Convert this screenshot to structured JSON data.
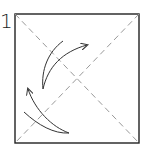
{
  "diagram": {
    "step_number": "1",
    "paper": {
      "stroke": "#222222",
      "fill": "#ffffff"
    },
    "creases": {
      "type": "dashed diagonal",
      "color": "#888888"
    },
    "arrows": [
      {
        "name": "fold-arrow-upper",
        "direction": "toward top-right"
      },
      {
        "name": "fold-arrow-lower",
        "direction": "toward upper-left"
      }
    ]
  }
}
